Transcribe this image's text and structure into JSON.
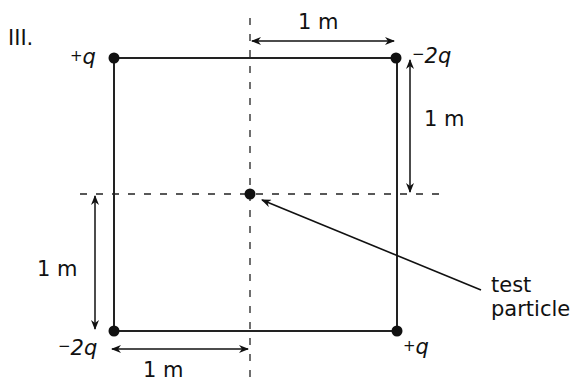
{
  "figure": {
    "label": "III.",
    "charges": [
      {
        "id": "top-left",
        "sign": "+",
        "symbol": "q",
        "text": "+q"
      },
      {
        "id": "top-right",
        "sign": "−",
        "symbol": "2q",
        "text": "−2q"
      },
      {
        "id": "bottom-left",
        "sign": "−",
        "symbol": "2q",
        "text": "−2q"
      },
      {
        "id": "bottom-right",
        "sign": "+",
        "symbol": "q",
        "text": "+q"
      }
    ],
    "dimensions": {
      "top": "1 m",
      "right": "1 m",
      "left": "1 m",
      "bottom": "1 m"
    },
    "test_particle": {
      "line1": "test",
      "line2": "particle"
    }
  },
  "colors": {
    "ink": "#111111",
    "background": "#ffffff"
  }
}
